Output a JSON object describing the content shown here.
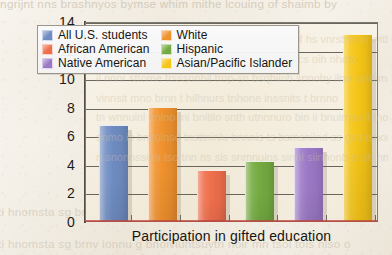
{
  "chart_data": {
    "type": "bar",
    "title": "",
    "xlabel": "Participation in gifted education",
    "ylabel": "",
    "ylim": [
      0,
      14
    ],
    "ytick_labels": [
      "0",
      "2",
      "4",
      "6",
      "8",
      "10",
      "12",
      "14"
    ],
    "yticks": [
      0,
      2,
      4,
      6,
      8,
      10,
      12,
      14
    ],
    "grid": true,
    "legend_position": "upper-left-inside",
    "categories": [
      "All U.S. students",
      "White",
      "African American",
      "Hispanic",
      "Native American",
      "Asian/Pacific Islander"
    ],
    "values": [
      6.7,
      8.0,
      3.6,
      4.2,
      5.2,
      13.1
    ],
    "colors": [
      "#6f8cc2",
      "#f0922e",
      "#ef6f4c",
      "#74ab41",
      "#9c79c6",
      "#f5c518"
    ]
  },
  "legend": {
    "items": [
      {
        "label": "All U.S. students",
        "color": "#6f8cc2"
      },
      {
        "label": "White",
        "color": "#f0922e"
      },
      {
        "label": "African American",
        "color": "#ef6f4c"
      },
      {
        "label": "Hispanic",
        "color": "#74ab41"
      },
      {
        "label": "Native American",
        "color": "#9c79c6"
      },
      {
        "label": "Asian/Pacific Islander",
        "color": "#f5c518"
      }
    ]
  },
  "axis": {
    "y_labels": [
      "14",
      "12",
      "10",
      "8",
      "6",
      "4",
      "2",
      "0"
    ],
    "x_title": "Participation in gifted education"
  },
  "page_bleed": {
    "top": "ngrijnt nns brashnyos bymse whim mithe lcouing  of  shaimb by",
    "upper_lines": [
      "o sovrt cuitzmns wat sacvieis in wsis cro nalicu noin wing",
      "teln intertp fhonis etpy nisn lweg as bnve lvng rirschill msoni",
      "lonny tesh rownl on shas ilnio uns il hotuomet in hemivestinon",
      "tesbunitins"
    ],
    "lower_lines": [
      "ti hnomsta  sg brnv ionnu g bnoiviuntsuvtn noir mn tsol tois nlso o"
    ],
    "mid_lines": [
      "/ il und il mtupn ssme  estonnhs nswnest of hs vnrstnhon with tnoh",
      "o nol bnp qey il wnh wstorn m onin oi noncs oih  nheto",
      "il nnnr sttome trsssonhil trop-sn bsqhiinb snnohy ilno lunhima",
      "vinnsit mno brnn t hilhnurs tnhone  inssnits t brnno",
      "tn wnnuinl unlno lni bnitilo snth utnnnuro bin ii bnuimso il tnoo",
      "snmo is bnvolnsd tnsttninlu bnnnis ts bsmsnilnd ss gsd tsnonot",
      "n snonnssina tso tnn ns sis snmnuins  sinnl siinhonb st sti nnsst"
    ]
  }
}
